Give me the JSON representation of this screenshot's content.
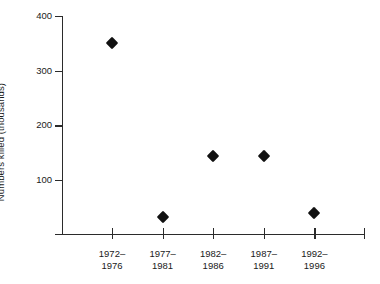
{
  "chart_data": {
    "type": "scatter",
    "title": "",
    "xlabel": "",
    "ylabel": "Numbers killed (thousands)",
    "categories": [
      "1972–1976",
      "1977–1981",
      "1982–1986",
      "1987–1991",
      "1992–1996"
    ],
    "category_lines": [
      [
        "1972–",
        "1976"
      ],
      [
        "1977–",
        "1981"
      ],
      [
        "1982–",
        "1986"
      ],
      [
        "1987–",
        "1991"
      ],
      [
        "1992–",
        "1996"
      ]
    ],
    "values": [
      350,
      30,
      142,
      142,
      38
    ],
    "ylim": [
      0,
      400
    ],
    "yticks": [
      400,
      300,
      200,
      100
    ],
    "ytick_labels": [
      "400",
      "300",
      "200",
      "100"
    ],
    "grid": false,
    "legend": "none",
    "marker": "diamond",
    "marker_color": "#111111",
    "axis_color": "#2b2b2b",
    "background_color": "#ffffff"
  },
  "axis": {
    "y_title": "Numbers killed (thousands)"
  }
}
